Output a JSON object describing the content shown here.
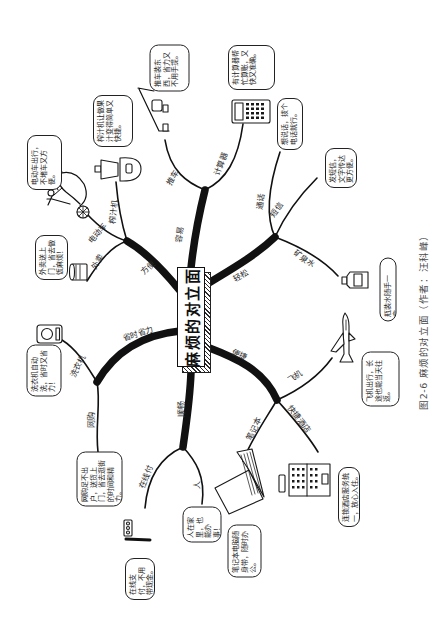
{
  "figure": {
    "caption": "图2-6  麻烦的对立面（作者：汪科峰）"
  },
  "mindmap": {
    "center": "麻烦的对立面",
    "branches": [
      {
        "label": "容易",
        "children": [
          {
            "label": "推车",
            "icon": "shopping-cart",
            "note": "推车装东西，省力又不用手提。"
          },
          {
            "label": "计算器",
            "icon": "calculator",
            "note": "有计算器帮忙算账，又快又准确。"
          }
        ]
      },
      {
        "label": "方便",
        "children": [
          {
            "label": "榨汁机",
            "icon": "juicer",
            "note": "榨汁机让做果汁变得简单又快捷。"
          },
          {
            "label": "电动车",
            "icon": "scooter",
            "note": "电动车出行，不堵车又方便。"
          },
          {
            "label": "外卖",
            "icon": "takeaway-cup",
            "note": "外卖送上门，省去做饭麻烦！"
          }
        ]
      },
      {
        "label": "省时省力",
        "children": [
          {
            "label": "洗衣机",
            "icon": "washing-machine",
            "note": "洗衣机自动洗，省时又省力！"
          },
          {
            "label": "网购",
            "icon": "",
            "note": "网购足不出户，送货上门，省去逛街的时间和精力。"
          }
        ]
      },
      {
        "label": "顺畅",
        "children": [
          {
            "label": "在线付",
            "icon": "pos-terminal",
            "note": "在线支付，不用带现金。"
          },
          {
            "label": "人",
            "icon": "",
            "note": "人在家里，也能办事！"
          }
        ]
      },
      {
        "label": "便捷",
        "children": [
          {
            "label": "飞机",
            "icon": "airplane",
            "note": "飞机出行，长途也能当天往返。"
          },
          {
            "label": "笔记本",
            "icon": "laptop",
            "note": "笔记本电脑随身带，随时办公。"
          },
          {
            "label": "快捷酒店",
            "icon": "hotel-building",
            "note": "连锁酒店服务统一，放心入住。"
          }
        ]
      },
      {
        "label": "轻松",
        "children": [
          {
            "label": "通话",
            "icon": "",
            "note": "想说话，拨个电话就行。"
          },
          {
            "label": "短信",
            "icon": "",
            "note": "发短信，文字传达更方便。"
          },
          {
            "label": "矿泉水",
            "icon": "bottle",
            "note": "瓶装水随手一拿。"
          }
        ]
      }
    ]
  }
}
